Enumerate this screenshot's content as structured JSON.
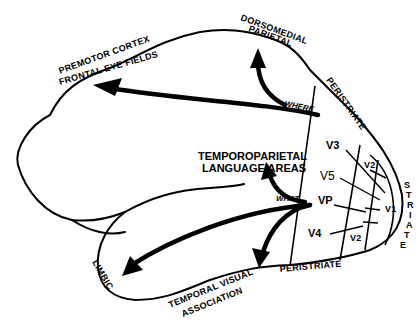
{
  "diagram": {
    "type": "brain-visual-pathways",
    "labels": {
      "premotor_line1": "PREMOTOR CORTEX",
      "premotor_line2": "FRONTAL EYE FIELDS",
      "dorsomedial_line1": "DORSOMEDIAL",
      "dorsomedial_line2": "PARIETAL",
      "peristriate_top": "PERISTRIATE",
      "peristriate_bottom": "PERISTRIATE",
      "striate": "STRIATE",
      "temporoparietal_line1": "TEMPOROPARIETAL",
      "temporoparietal_line2": "LANGUAGE AREAS",
      "where": "WHERE",
      "what": "WHAT",
      "limbic": "LIMBIC",
      "temporal_line1": "TEMPORAL VISUAL",
      "temporal_line2": "ASSOCIATION"
    },
    "visual_areas": {
      "v3": "V3",
      "v5": "V5",
      "vp": "VP",
      "v4": "V4",
      "v2_top": "V2",
      "v1": "V1",
      "v2_bottom": "V2"
    }
  }
}
